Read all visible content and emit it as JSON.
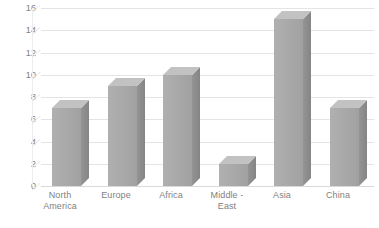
{
  "chart_data": {
    "type": "bar",
    "title": "",
    "subtitle": "",
    "xlabel": "",
    "ylabel": "",
    "categories": [
      "North America",
      "Europe",
      "Africa",
      "Middle - East",
      "Asia",
      "China"
    ],
    "values": [
      7,
      9,
      10,
      2,
      15,
      7
    ],
    "ylim": [
      0,
      16
    ],
    "ytick_labels": [
      "0",
      "2",
      "4",
      "6",
      "8",
      "10",
      "12",
      "14",
      "16"
    ],
    "ytick_values": [
      0,
      2,
      4,
      6,
      8,
      10,
      12,
      14,
      16
    ],
    "grid": true,
    "grid_axis": "y",
    "legend": false,
    "legend_position": "none",
    "style": "3d-clustered-column",
    "series": [
      {
        "name": "Series 1",
        "values": [
          7,
          9,
          10,
          2,
          15,
          7
        ]
      }
    ],
    "colors": {
      "bar_front": "#a8a8a8",
      "bar_side": "#8c8c8c",
      "bar_top": "#bdbdbd",
      "gridline": "#e4e4e4",
      "floor": "#d9d9d9",
      "text": "#808080",
      "background": "#ffffff"
    }
  },
  "axis": {
    "y_labels": [
      {
        "text": "16",
        "value": 16
      },
      {
        "text": "14",
        "value": 14
      },
      {
        "text": "12",
        "value": 12
      },
      {
        "text": "10",
        "value": 10
      },
      {
        "text": "8",
        "value": 8
      },
      {
        "text": "6",
        "value": 6
      },
      {
        "text": "4",
        "value": 4
      },
      {
        "text": "2",
        "value": 2
      },
      {
        "text": "0",
        "value": 0
      }
    ],
    "x_labels": [
      {
        "line1": "North",
        "line2": "America"
      },
      {
        "line1": "Europe",
        "line2": ""
      },
      {
        "line1": "Africa",
        "line2": ""
      },
      {
        "line1": "Middle -",
        "line2": "East"
      },
      {
        "line1": "Asia",
        "line2": ""
      },
      {
        "line1": "China",
        "line2": ""
      }
    ]
  }
}
